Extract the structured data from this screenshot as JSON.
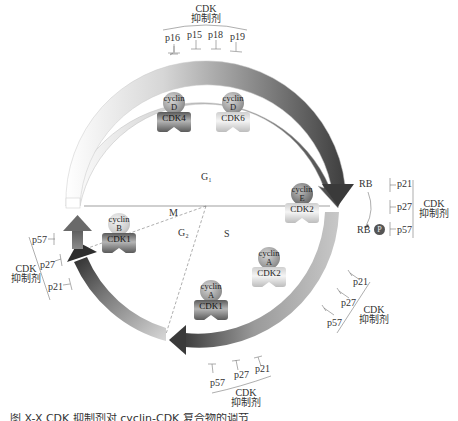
{
  "diagram": {
    "type": "cell-cycle",
    "phases": {
      "g1": "G₁",
      "s": "S",
      "g2": "G₂",
      "m": "M"
    },
    "complexes": [
      {
        "id": "cyclinD-cdk4",
        "cyclin_line1": "cyclin",
        "cyclin_line2": "D",
        "cdk": "CDK4",
        "shade": "dark"
      },
      {
        "id": "cyclinD-cdk6",
        "cyclin_line1": "cyclin",
        "cyclin_line2": "D",
        "cdk": "CDK6",
        "shade": "light"
      },
      {
        "id": "cyclinE-cdk2",
        "cyclin_line1": "cyclin",
        "cyclin_line2": "E",
        "cdk": "CDK2",
        "shade": "light"
      },
      {
        "id": "cyclinA-cdk2",
        "cyclin_line1": "cyclin",
        "cyclin_line2": "A",
        "cdk": "CDK2",
        "shade": "light"
      },
      {
        "id": "cyclinA-cdk1",
        "cyclin_line1": "cyclin",
        "cyclin_line2": "A",
        "cdk": "CDK1",
        "shade": "dark"
      },
      {
        "id": "cyclinB-cdk1",
        "cyclin_line1": "cyclin",
        "cyclin_line2": "B",
        "cdk": "CDK1",
        "shade": "dark"
      }
    ],
    "inhibitor_groups": {
      "top": {
        "title_line1": "CDK",
        "title_line2": "抑制剂",
        "members": [
          "p16",
          "p15",
          "p18",
          "p19"
        ]
      },
      "right": {
        "title_line1": "CDK",
        "title_line2": "抑制剂",
        "members": [
          "p21",
          "p27",
          "p57"
        ]
      },
      "lower_right": {
        "title_line1": "CDK",
        "title_line2": "抑制剂",
        "members": [
          "p21",
          "p27",
          "p57"
        ]
      },
      "bottom": {
        "title_line1": "CDK",
        "title_line2": "抑制剂",
        "members": [
          "p57",
          "p27",
          "p21"
        ]
      },
      "left": {
        "title_line1": "CDK",
        "title_line2": "抑制剂",
        "members": [
          "p57",
          "p27",
          "p21"
        ]
      }
    },
    "rb": {
      "unphosphorylated": "RB",
      "phosphorylated": "RB",
      "phospho_symbol": "P"
    },
    "colors": {
      "arrow_light": "#e8e8e8",
      "arrow_dark": "#4a4a4a",
      "line": "#777777",
      "text": "#333333"
    }
  },
  "caption": "图 X-X  CDK 抑制剂对 cyclin-CDK 复合物的调节"
}
